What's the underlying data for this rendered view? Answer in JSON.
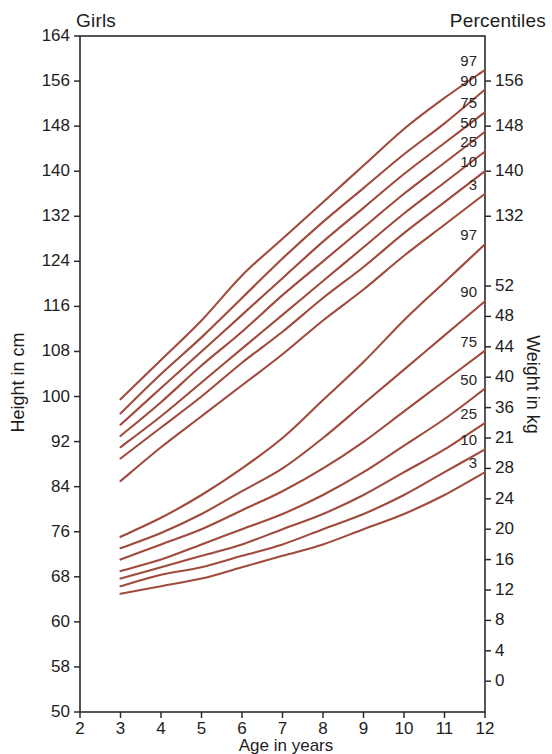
{
  "header": {
    "left_label": "Girls",
    "right_label": "Percentiles"
  },
  "axes": {
    "y_left_title": "Height in cm",
    "y_right_title": "Weight in kg",
    "x_title": "Age in years"
  },
  "chart_data": {
    "type": "line",
    "title": "Girls",
    "subtitle": "Percentiles",
    "xlabel": "Age in years",
    "ylabel": "Height in cm",
    "y2label": "Weight in kg",
    "grid": false,
    "legend_position": "right-inline",
    "xlim": [
      2,
      12
    ],
    "x_ticks": [
      "2",
      "3",
      "4",
      "5",
      "6",
      "7",
      "8",
      "9",
      "10",
      "11",
      "12"
    ],
    "y_left_ticks": [
      "164",
      "156",
      "148",
      "140",
      "132",
      "124",
      "116",
      "108",
      "100",
      "92",
      "84",
      "76",
      "68",
      "60",
      "58",
      "50"
    ],
    "y_right_height_ticks": [
      "156",
      "148",
      "140",
      "132"
    ],
    "y_right_weight_ticks": [
      "52",
      "48",
      "44",
      "40",
      "36",
      "21",
      "28",
      "24",
      "20",
      "16",
      "12",
      "8",
      "4",
      "0"
    ],
    "curve_color": "#A04A3C",
    "x": [
      3,
      4,
      5,
      6,
      7,
      8,
      9,
      10,
      11,
      12
    ],
    "height_series": [
      {
        "name": "97",
        "values": [
          99.5,
          106.5,
          113.5,
          121.5,
          128.0,
          134.5,
          141.0,
          147.5,
          153.0,
          158.0
        ]
      },
      {
        "name": "90",
        "values": [
          97.0,
          104.0,
          110.5,
          117.5,
          124.5,
          131.0,
          137.0,
          143.0,
          148.5,
          154.5
        ]
      },
      {
        "name": "75",
        "values": [
          95.0,
          101.5,
          108.0,
          114.5,
          121.0,
          127.5,
          133.5,
          139.5,
          145.0,
          150.5
        ]
      },
      {
        "name": "50",
        "values": [
          93.0,
          99.0,
          105.5,
          111.5,
          118.0,
          124.0,
          130.0,
          136.0,
          141.5,
          147.0
        ]
      },
      {
        "name": "25",
        "values": [
          91.0,
          96.5,
          102.5,
          108.5,
          114.5,
          120.5,
          126.5,
          132.5,
          138.0,
          143.5
        ]
      },
      {
        "name": "10",
        "values": [
          89.0,
          94.5,
          100.0,
          106.0,
          111.5,
          117.5,
          123.0,
          129.0,
          134.5,
          140.0
        ]
      },
      {
        "name": "3",
        "values": [
          85.0,
          91.0,
          96.5,
          102.0,
          107.5,
          113.5,
          119.0,
          125.0,
          130.5,
          136.0
        ]
      }
    ],
    "weight_series": [
      {
        "name": "97",
        "values": [
          19.0,
          21.5,
          24.5,
          28.0,
          32.0,
          37.0,
          42.0,
          47.5,
          52.5,
          57.5
        ]
      },
      {
        "name": "90",
        "values": [
          17.5,
          19.5,
          22.0,
          25.0,
          28.0,
          32.0,
          36.5,
          41.0,
          45.5,
          50.0
        ]
      },
      {
        "name": "75",
        "values": [
          16.0,
          18.0,
          20.0,
          22.5,
          25.0,
          28.0,
          31.5,
          35.5,
          39.5,
          43.5
        ]
      },
      {
        "name": "50",
        "values": [
          14.5,
          16.0,
          18.0,
          20.0,
          22.0,
          24.5,
          27.5,
          31.0,
          34.5,
          38.5
        ]
      },
      {
        "name": "25",
        "values": [
          13.5,
          15.0,
          16.5,
          18.0,
          20.0,
          22.0,
          24.5,
          27.5,
          30.5,
          34.0
        ]
      },
      {
        "name": "10",
        "values": [
          12.5,
          14.0,
          15.0,
          16.5,
          18.0,
          20.0,
          22.0,
          24.5,
          27.5,
          30.5
        ]
      },
      {
        "name": "3",
        "values": [
          11.5,
          12.5,
          13.5,
          15.0,
          16.5,
          18.0,
          20.0,
          22.0,
          24.5,
          27.5
        ]
      }
    ],
    "height_percentile_labels": [
      "97",
      "90",
      "75",
      "50",
      "25",
      "10",
      "3"
    ],
    "weight_percentile_labels": [
      "97",
      "90",
      "75",
      "50",
      "25",
      "10",
      "3"
    ]
  }
}
